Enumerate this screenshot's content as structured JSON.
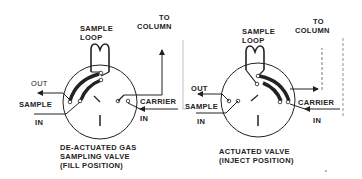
{
  "diagram": {
    "left_valve": {
      "caption": [
        "DE-ACTUATED GAS",
        "SAMPLING VALVE",
        "(FILL POSITION)"
      ],
      "labels": {
        "sample_loop": [
          "SAMPLE",
          "LOOP"
        ],
        "to_column": [
          "TO",
          "COLUMN"
        ],
        "out": "OUT",
        "sample": "SAMPLE",
        "in_sample": "IN",
        "carrier": "CARRIER",
        "in_carrier": "IN"
      }
    },
    "right_valve": {
      "caption": [
        "ACTUATED VALVE",
        "(INJECT POSITION)"
      ],
      "labels": {
        "sample_loop": [
          "SAMPLE",
          "LOOP"
        ],
        "to_column": [
          "TO",
          "COLUMN"
        ],
        "out": "OUT",
        "sample": "SAMPLE",
        "in_sample": "IN",
        "carrier": "CARRIER",
        "in_carrier": "IN"
      }
    },
    "colors": {
      "line": "#222222",
      "background": "#ffffff",
      "dashed": "#777777"
    }
  }
}
